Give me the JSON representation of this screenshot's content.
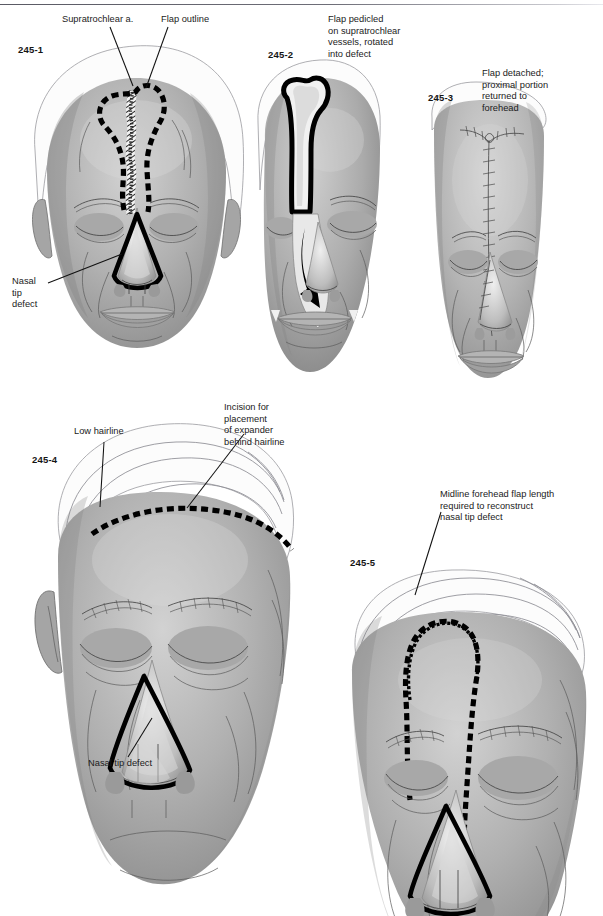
{
  "page": {
    "background_color": "#ffffff",
    "ink_color": "#1a1a1a",
    "has_header_rule": true
  },
  "figure": {
    "panel_count": 5
  },
  "panels": [
    {
      "id": "245-1",
      "number": "245-1",
      "view": "frontal face with forehead flap design marked",
      "labels": [
        {
          "name": "supratrochlear-artery",
          "text": "Supratrochlear a."
        },
        {
          "name": "flap-outline",
          "text": "Flap outline"
        },
        {
          "name": "nasal-tip-defect",
          "text": "Nasal\ntip\ndefect"
        }
      ]
    },
    {
      "id": "245-2",
      "number": "245-2",
      "view": "flap raised and rotated into nasal defect",
      "labels": [
        {
          "name": "flap-pedicled",
          "text": "Flap pedicled\non supratrochlear\nvessels, rotated\ninto defect"
        }
      ]
    },
    {
      "id": "245-3",
      "number": "245-3",
      "view": "flap divided, donor site closed",
      "labels": [
        {
          "name": "flap-detached",
          "text": "Flap detached;\nproximal portion\nreturned to\nforehead"
        }
      ]
    },
    {
      "id": "245-4",
      "number": "245-4",
      "view": "oblique face with low hairline and expander incision",
      "labels": [
        {
          "name": "low-hairline",
          "text": "Low hairline"
        },
        {
          "name": "expander-incision",
          "text": "Incision for\nplacement\nof expander\nbehind hairline"
        },
        {
          "name": "nasal-tip-defect",
          "text": "Nasal tip defect"
        }
      ]
    },
    {
      "id": "245-5",
      "number": "245-5",
      "view": "oblique face with extended midline flap design into hairline",
      "labels": [
        {
          "name": "flap-length-required",
          "text": "Midline forehead flap length\nrequired to reconstruct\nnasal tip defect"
        }
      ]
    }
  ]
}
